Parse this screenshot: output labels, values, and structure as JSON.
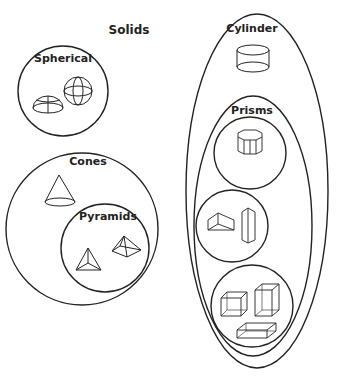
{
  "title": "Solids",
  "groups": {
    "spherical": {
      "label": "Spherical",
      "shapes": [
        "hemisphere",
        "sphere"
      ]
    },
    "cones": {
      "label": "Cones",
      "shapes": [
        "cone"
      ]
    },
    "pyramids": {
      "label": "Pyramids",
      "shapes": [
        "triangular-pyramid",
        "square-pyramid"
      ]
    },
    "cylinder": {
      "label": "Cylinder",
      "shapes": [
        "cylinder"
      ]
    },
    "prisms": {
      "label": "Prisms",
      "shapes": [
        "octagonal-prism",
        "triangular-prism",
        "triangular-prism-tall",
        "cube",
        "rectangular-prism-tall",
        "rectangular-prism-flat"
      ]
    }
  },
  "colors": {
    "stroke": "#222222",
    "background": "#ffffff"
  }
}
